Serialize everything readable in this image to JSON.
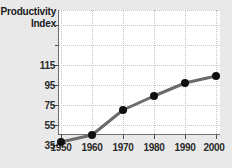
{
  "chart_data": {
    "type": "line",
    "title": "Productivity Index",
    "title_lines": [
      "Productivity",
      "Index"
    ],
    "xlabel": "",
    "ylabel": "Productivity Index",
    "x": [
      1950,
      1960,
      1970,
      1980,
      1990,
      2000
    ],
    "values": [
      38,
      45,
      70,
      84,
      97,
      104
    ],
    "categories": [
      "1950",
      "1960",
      "1970",
      "1980",
      "1990",
      "2000"
    ],
    "xtick_labels": [
      "1950",
      "1960",
      "1970",
      "1980",
      "1990",
      "2000"
    ],
    "ytick_labels": [
      "115",
      "95",
      "75",
      "55",
      "35"
    ],
    "ytick_values": [
      115,
      95,
      75,
      55,
      35
    ],
    "yticks_unlabeled": [
      135,
      155,
      175
    ],
    "xlim": [
      1945,
      2005
    ],
    "ylim": [
      25,
      185
    ],
    "grid": true,
    "grid_style": "dotted",
    "legend": "none",
    "series": [
      {
        "name": "Productivity Index",
        "values": [
          38,
          45,
          70,
          84,
          97,
          104
        ],
        "line_color": "#6b6b6b",
        "marker_color": "#111111",
        "marker": "circle"
      }
    ],
    "colors": {
      "background": "#e9e9e9",
      "plot_background": "#ffffff",
      "axis": "#6e6e6e",
      "grid": "#c6c6c6",
      "line": "#6b6b6b",
      "marker": "#111111",
      "text": "#1a1a1a"
    }
  }
}
